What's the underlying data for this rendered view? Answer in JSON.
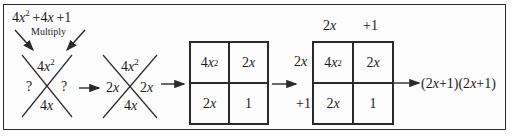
{
  "diagram": {
    "type": "factoring-by-x-and-box-method",
    "expression": {
      "coef_a": "4",
      "var": "x",
      "exp": "2",
      "rest": "+4",
      "rest_var": "x",
      "const": "+1"
    },
    "multiply_label": "Multiply",
    "stage1_x": {
      "top": {
        "coef": "4",
        "var": "x",
        "exp": "2"
      },
      "bottom": {
        "coef": "4",
        "var": "x"
      },
      "left": "?",
      "right": "?"
    },
    "stage2_x": {
      "top": {
        "coef": "4",
        "var": "x",
        "exp": "2"
      },
      "bottom": {
        "coef": "4",
        "var": "x"
      },
      "left": {
        "coef": "2",
        "var": "x"
      },
      "right": {
        "coef": "2",
        "var": "x"
      }
    },
    "box1": {
      "cells": [
        {
          "coef": "4",
          "var": "x",
          "exp": "2"
        },
        {
          "coef": "2",
          "var": "x",
          "exp": ""
        },
        {
          "coef": "2",
          "var": "x",
          "exp": ""
        },
        {
          "coef": "1",
          "var": "",
          "exp": ""
        }
      ]
    },
    "box2": {
      "top_labels": [
        {
          "coef": "2",
          "var": "x"
        },
        {
          "coef": "+1",
          "var": ""
        }
      ],
      "left_labels": [
        {
          "coef": "2",
          "var": "x"
        },
        {
          "coef": "+1",
          "var": ""
        }
      ],
      "cells": [
        {
          "coef": "4",
          "var": "x",
          "exp": "2"
        },
        {
          "coef": "2",
          "var": "x",
          "exp": ""
        },
        {
          "coef": "2",
          "var": "x",
          "exp": ""
        },
        {
          "coef": "1",
          "var": "",
          "exp": ""
        }
      ]
    },
    "result": {
      "open1": "(2",
      "v1": "x",
      "close1": "+1)(2",
      "v2": "x",
      "close2": "+1)"
    },
    "colors": {
      "ink": "#1a1a1a",
      "line": "#2a2a2a",
      "background": "#ffffff"
    }
  }
}
